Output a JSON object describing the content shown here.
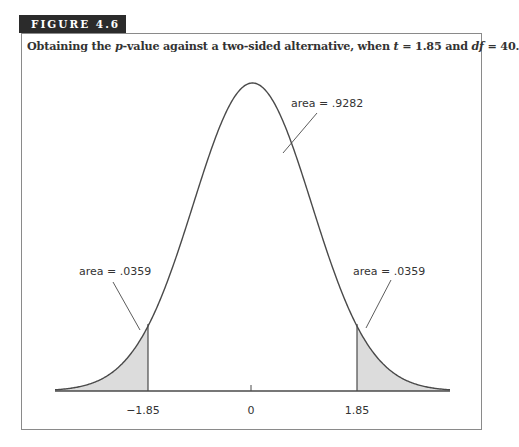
{
  "figure": {
    "label": "FIGURE 4.6",
    "caption_parts": {
      "p1": "Obtaining the ",
      "p_var": "p",
      "p2": "-value against a two-sided alternative, when ",
      "t_var": "t",
      "p3": " = 1.85 and ",
      "df_var": "df",
      "p4": " = 40."
    }
  },
  "annotations": {
    "center_area": "area = .9282",
    "left_area": "area = .0359",
    "right_area": "area = .0359"
  },
  "axis": {
    "ticks": [
      "−1.85",
      "0",
      "1.85"
    ]
  },
  "colors": {
    "shade": "#dcdcdc",
    "line": "#4a4a4a"
  }
}
